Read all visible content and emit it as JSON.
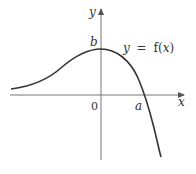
{
  "diagram": {
    "type": "function-graph",
    "axes": {
      "x_label": "x",
      "y_label": "y",
      "origin_label": "0"
    },
    "labels": {
      "y_intercept": "b",
      "x_intercept": "a",
      "equation_lhs": "y",
      "equation_eq": "=",
      "equation_f": "f(",
      "equation_var": "x",
      "equation_close": ")"
    },
    "curve": {
      "description": "smooth curve rising from left asymptote near x-axis, local maximum at y-intercept b, crossing x-axis at a, then falling steeply",
      "color": "#333333"
    },
    "axis_color": "#555555"
  }
}
